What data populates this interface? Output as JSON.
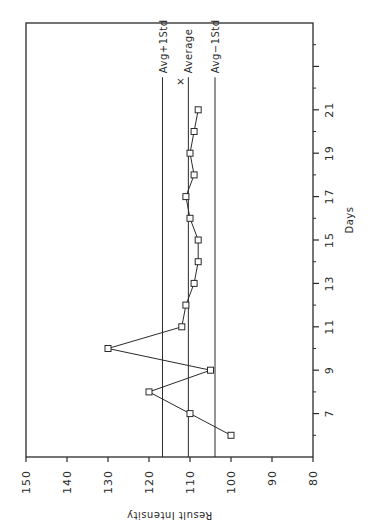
{
  "chart_data": {
    "type": "line",
    "title": "",
    "xlabel": "Days",
    "ylabel": "Result Intensity",
    "xlim": [
      5,
      25
    ],
    "ylim": [
      80,
      150
    ],
    "x_ticks_major": [
      7,
      9,
      11,
      13,
      15,
      17,
      19,
      21,
      23
    ],
    "x_tick_labels": [
      "7",
      "9",
      "11",
      "13",
      "15",
      "17",
      "19",
      "21",
      ""
    ],
    "x_ticks_minor": [
      6,
      8,
      10,
      12,
      14,
      16,
      18,
      20,
      22,
      24
    ],
    "y_ticks": [
      150,
      140,
      130,
      120,
      110,
      100,
      90,
      80
    ],
    "y_tick_labels": [
      "150",
      "140",
      "130",
      "120",
      "110",
      "100",
      "90",
      "80"
    ],
    "grid": false,
    "orientation": "rotated -90deg on page",
    "series": [
      {
        "name": "Result",
        "marker": "square",
        "x": [
          6,
          7,
          8,
          9,
          10,
          11,
          12,
          13,
          14,
          15,
          16,
          17,
          18,
          19,
          20,
          21
        ],
        "values": [
          100,
          110,
          120,
          105,
          130,
          112,
          111,
          109,
          108,
          108,
          110,
          111,
          109,
          110,
          109,
          108
        ]
      }
    ],
    "reference_lines": [
      {
        "name": "Avg+1Std",
        "label": "Avg+1Std",
        "value": 116.7
      },
      {
        "name": "Average",
        "label": "Average",
        "value": 110.4,
        "marker": "×"
      },
      {
        "name": "Avg-1Std",
        "label": "Avg−1Std",
        "value": 103.9
      }
    ],
    "colors": {
      "line": "#2a2a2a",
      "background": "#ffffff"
    }
  }
}
